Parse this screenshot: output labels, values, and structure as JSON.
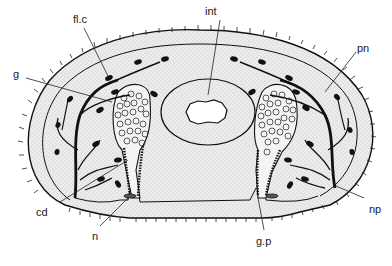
{
  "figure": {
    "type": "anatomical cross-section line drawing",
    "colors": {
      "ink": "#111111",
      "stipple_fill": "#e9e9e9",
      "background": "#ffffff",
      "lumen": "#ffffff"
    }
  },
  "labels": [
    {
      "id": "fl_c",
      "text": "fl.c",
      "x": 73,
      "y": 14
    },
    {
      "id": "g",
      "text": "g",
      "x": 13,
      "y": 69
    },
    {
      "id": "int",
      "text": "int",
      "x": 205,
      "y": 6
    },
    {
      "id": "pn",
      "text": "pn",
      "x": 357,
      "y": 43
    },
    {
      "id": "cd",
      "text": "cd",
      "x": 36,
      "y": 207
    },
    {
      "id": "n",
      "text": "n",
      "x": 92,
      "y": 231
    },
    {
      "id": "g_p",
      "text": "g.p",
      "x": 256,
      "y": 236
    },
    {
      "id": "np",
      "text": "np",
      "x": 369,
      "y": 204
    }
  ]
}
